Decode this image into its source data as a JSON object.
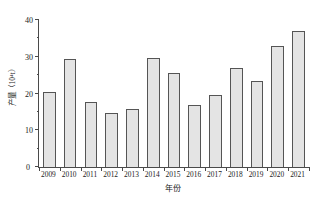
{
  "chart_data": {
    "type": "bar",
    "title": "",
    "subtitle": "",
    "xlabel": "年份",
    "ylabel": "产量（10⁴t）",
    "categories": [
      "2009",
      "2010",
      "2011",
      "2012",
      "2013",
      "2014",
      "2015",
      "2016",
      "2017",
      "2018",
      "2019",
      "2020",
      "2021"
    ],
    "values": [
      20.4,
      29.5,
      17.6,
      14.8,
      15.9,
      29.6,
      25.6,
      16.9,
      19.7,
      26.9,
      23.4,
      33.0,
      37.0
    ],
    "ylim": [
      0,
      40
    ],
    "ytick_labels": [
      "0",
      "10",
      "20",
      "30",
      "40"
    ],
    "ytick_values": [
      0,
      10,
      20,
      30,
      40
    ],
    "yminor_values": [
      5,
      15,
      25,
      35
    ],
    "grid": false,
    "legend": null,
    "annotations": [],
    "bar_fill_color": "#e4e4e4",
    "bar_edge_color": "#555555",
    "axis_color": "#4a4a4a",
    "background_color": "#ffffff",
    "zero_label": "0"
  }
}
